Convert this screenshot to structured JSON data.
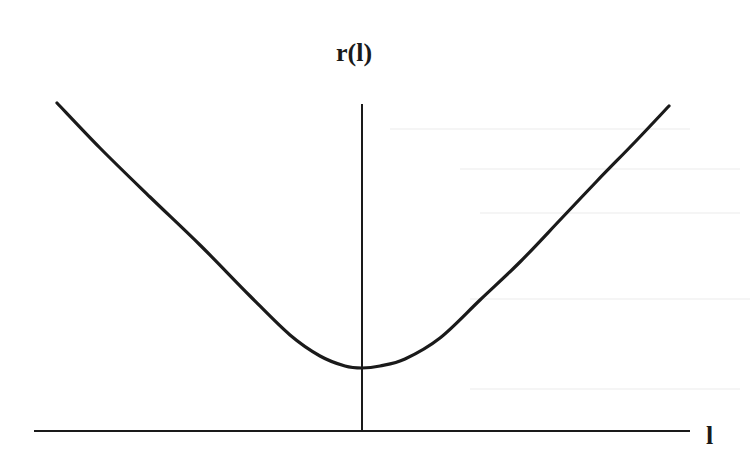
{
  "figure": {
    "y_axis_label": "r(l)",
    "x_axis_label": "l",
    "line_color": "#1a1a1a",
    "background_color": "#ffffff"
  },
  "chart_data": {
    "type": "line",
    "title": "",
    "xlabel": "l",
    "ylabel": "r(l)",
    "axes": {
      "x_axis": {
        "x1": 34,
        "x2": 690,
        "y": 431
      },
      "y_axis": {
        "x": 362,
        "y1": 104,
        "y2": 432
      }
    },
    "curve_pixels": [
      [
        57,
        103
      ],
      [
        100,
        148
      ],
      [
        150,
        197
      ],
      [
        200,
        245
      ],
      [
        250,
        296
      ],
      [
        290,
        335
      ],
      [
        320,
        356
      ],
      [
        345,
        366
      ],
      [
        362,
        368
      ],
      [
        380,
        366
      ],
      [
        405,
        359
      ],
      [
        440,
        338
      ],
      [
        480,
        300
      ],
      [
        520,
        262
      ],
      [
        560,
        220
      ],
      [
        597,
        181
      ],
      [
        635,
        142
      ],
      [
        669,
        106
      ]
    ],
    "grid": false,
    "legend": null,
    "ticks": "none"
  }
}
